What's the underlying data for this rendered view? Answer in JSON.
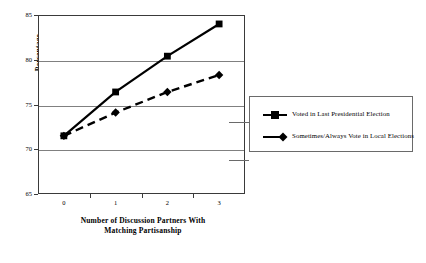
{
  "chart_data": {
    "type": "line",
    "title": "",
    "xlabel": "Number of Discussion Partners With Matching Partisanship",
    "xlabel_line1": "Number of Discussion Partners With",
    "xlabel_line2": "Matching Partisanship",
    "ylabel": "Percentage",
    "categories": [
      "0",
      "1",
      "2",
      "3"
    ],
    "x": [
      0,
      1,
      2,
      3
    ],
    "ylim": [
      65,
      85
    ],
    "yticks": [
      65,
      70,
      75,
      80,
      85
    ],
    "ytick_labels": [
      "65",
      "70",
      "75",
      "80",
      "85"
    ],
    "grid": true,
    "legend_position": "right",
    "series": [
      {
        "name": "Voted in Last Presidential Election",
        "values": [
          71.5,
          76.4,
          80.4,
          84.0
        ],
        "marker": "square",
        "linestyle": "solid",
        "color": "#000000"
      },
      {
        "name": "Sometimes/Always Vote in Local Elections",
        "values": [
          71.5,
          74.1,
          76.4,
          78.3
        ],
        "marker": "diamond",
        "linestyle": "dashed",
        "color": "#000000"
      }
    ]
  },
  "legend": {
    "items": [
      {
        "label": "Voted in Last Presidential Election"
      },
      {
        "label": "Sometimes/Always Vote in Local Elections"
      }
    ]
  },
  "colors": {
    "line": "#000000",
    "grid": "#808080",
    "frame": "#3a3a3a",
    "legend_border": "#6a6a6a",
    "background": "#ffffff"
  }
}
